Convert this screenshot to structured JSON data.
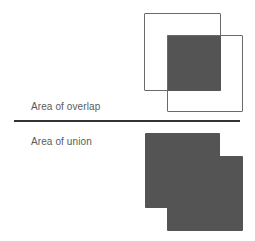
{
  "overlap_panel": {
    "label": "Area of overlap",
    "box_a": {
      "x": 144,
      "y": 13,
      "w": 77,
      "h": 78
    },
    "box_b": {
      "x": 167,
      "y": 35,
      "w": 76,
      "h": 77
    },
    "intersection": {
      "x": 167,
      "y": 35,
      "w": 54,
      "h": 56
    }
  },
  "union_panel": {
    "label": "Area of union",
    "box_a": {
      "x": 145,
      "y": 133,
      "w": 75,
      "h": 75
    },
    "box_b": {
      "x": 167,
      "y": 156,
      "w": 76,
      "h": 75
    }
  },
  "colors": {
    "fill": "#545454",
    "outline": "#6a6a6a",
    "divider": "#333333",
    "text": "#5a5a5a"
  }
}
